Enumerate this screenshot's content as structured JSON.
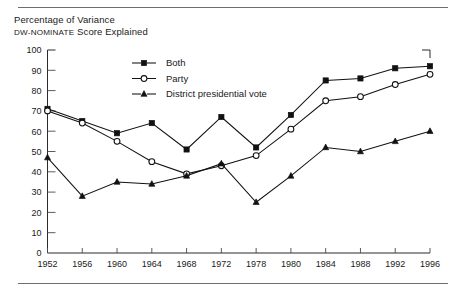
{
  "caption": {
    "line1": "Percentage of Variance",
    "line2_small": "DW-NOMINATE",
    "line2_rest": " Score Explained"
  },
  "rules": {
    "top_label": "top-divider",
    "bottom_label": "bottom-divider"
  },
  "chart_data": {
    "type": "line",
    "title": "Percentage of Variance DW-NOMINATE Score Explained",
    "xlabel": "",
    "ylabel": "",
    "ylim": [
      0,
      100
    ],
    "ytick_step": 10,
    "grid": false,
    "legend_position": "top-center",
    "categories": [
      "1952",
      "1956",
      "1960",
      "1964",
      "1968",
      "1972",
      "1978",
      "1980",
      "1984",
      "1988",
      "1992",
      "1996"
    ],
    "yticks": [
      "0",
      "10",
      "20",
      "30",
      "40",
      "50",
      "60",
      "70",
      "80",
      "90",
      "100"
    ],
    "series": [
      {
        "name": "Both",
        "marker": "filled-square",
        "values": [
          71,
          65,
          59,
          64,
          51,
          67,
          52,
          68,
          85,
          86,
          91,
          92
        ]
      },
      {
        "name": "Party",
        "marker": "open-circle",
        "values": [
          70,
          64,
          55,
          45,
          39,
          43,
          48,
          61,
          75,
          77,
          83,
          88
        ]
      },
      {
        "name": "District presidential vote",
        "marker": "filled-triangle",
        "values": [
          47,
          28,
          35,
          34,
          38,
          44,
          25,
          38,
          52,
          50,
          55,
          60
        ]
      }
    ]
  }
}
